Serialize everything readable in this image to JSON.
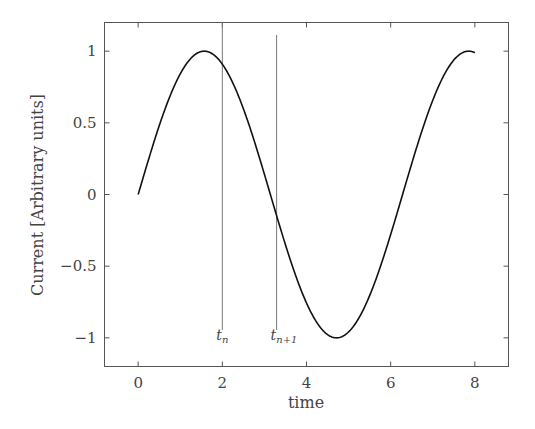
{
  "chart_data": {
    "type": "line",
    "title": "",
    "xlabel": "time",
    "ylabel": "Current [Arbitrary units]",
    "xlim": [
      -0.8,
      8.8
    ],
    "ylim": [
      -1.2,
      1.2
    ],
    "xticks": [
      0,
      2,
      4,
      6,
      8
    ],
    "xtick_labels": [
      "0",
      "2",
      "4",
      "6",
      "8"
    ],
    "yticks": [
      1,
      0.5,
      0,
      -0.5,
      -1
    ],
    "ytick_labels": [
      "1",
      "0.5",
      "0",
      "−0.5",
      "−1"
    ],
    "grid": false,
    "legend": null,
    "series": [
      {
        "name": "current",
        "function": "sin(t)",
        "x": [
          0,
          0.5,
          1,
          1.5,
          1.5708,
          2,
          2.5,
          3,
          3.1416,
          3.5,
          4,
          4.5,
          4.7124,
          5,
          5.5,
          6,
          6.2832,
          6.5,
          7,
          7.5,
          7.854,
          8
        ],
        "y": [
          0,
          0.479,
          0.841,
          0.997,
          1.0,
          0.909,
          0.598,
          0.141,
          0.0,
          -0.351,
          -0.757,
          -0.978,
          -1.0,
          -0.959,
          -0.706,
          -0.279,
          0.0,
          0.215,
          0.657,
          0.938,
          1.0,
          0.989
        ],
        "color": "#111111"
      }
    ],
    "annotations": [
      {
        "type": "vline",
        "x": 2.0,
        "label": "t",
        "subscript": "n"
      },
      {
        "type": "vline",
        "x": 3.29,
        "label": "t",
        "subscript": "n+1"
      }
    ]
  }
}
